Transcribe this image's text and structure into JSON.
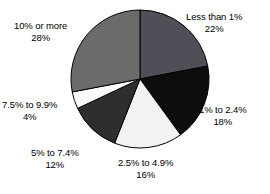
{
  "chart_data": {
    "type": "pie",
    "title": "",
    "subtitle": "",
    "xlabel": "",
    "ylabel": "",
    "legend_position": "none",
    "grid": false,
    "start_angle_deg": 0,
    "direction": "clockwise",
    "categories": [
      "Less than 1%",
      "1% to 2.4%",
      "2.5% to 4.9%",
      "5% to 7.4%",
      "7.5% to 9.9%",
      "10% or more"
    ],
    "values": [
      22,
      18,
      16,
      12,
      4,
      28
    ],
    "value_labels": [
      "22%",
      "18%",
      "16%",
      "12%",
      "4%",
      "28%"
    ],
    "colors": [
      "#4f4f57",
      "#0d0d0d",
      "#f2f2f2",
      "#2e2e2e",
      "#fafafa",
      "#6b6b6b"
    ],
    "slice_outline_color": "#000000",
    "slices": [
      {
        "label": "Less than 1%",
        "value": 22,
        "value_label": "22%",
        "color": "#4f4f57"
      },
      {
        "label": "1% to 2.4%",
        "value": 18,
        "value_label": "18%",
        "color": "#0d0d0d"
      },
      {
        "label": "2.5% to 4.9%",
        "value": 16,
        "value_label": "16%",
        "color": "#f2f2f2"
      },
      {
        "label": "5% to 7.4%",
        "value": 12,
        "value_label": "12%",
        "color": "#2e2e2e"
      },
      {
        "label": "7.5% to 9.9%",
        "value": 4,
        "value_label": "4%",
        "color": "#fafafa"
      },
      {
        "label": "10% or more",
        "value": 28,
        "value_label": "28%",
        "color": "#6b6b6b"
      }
    ]
  },
  "labels": {
    "less_than_1": {
      "name": "Less than 1%",
      "value": "22%"
    },
    "one_to_24": {
      "name": "1% to 2.4%",
      "value": "18%"
    },
    "t25_to_49": {
      "name": "2.5% to 4.9%",
      "value": "16%"
    },
    "five_to_74": {
      "name": "5% to 7.4%",
      "value": "12%"
    },
    "s75_to_99": {
      "name": "7.5% to 9.9%",
      "value": "4%"
    },
    "ten_or_more": {
      "name": "10% or more",
      "value": "28%"
    }
  }
}
